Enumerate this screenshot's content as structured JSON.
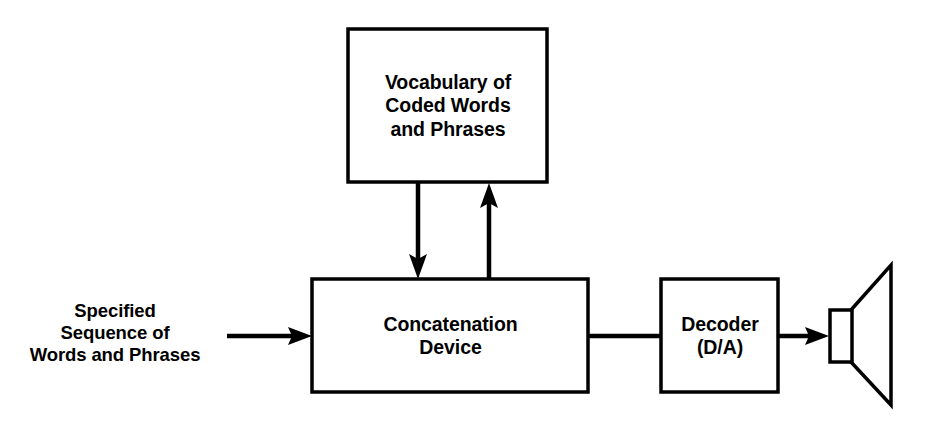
{
  "diagram": {
    "background_color": "#ffffff",
    "stroke_color": "#000000",
    "nodes": {
      "vocabulary": {
        "label": "Vocabulary of\nCoded Words\nand Phrases",
        "shape": "rectangle"
      },
      "concatenation": {
        "label": "Concatenation\nDevice",
        "shape": "rectangle"
      },
      "decoder": {
        "label": "Decoder\n(D/A)",
        "shape": "rectangle"
      },
      "input": {
        "label": "Specified\nSequence of\nWords and Phrases",
        "shape": "text"
      },
      "speaker": {
        "label": "loudspeaker",
        "shape": "horn"
      }
    },
    "connections": [
      {
        "name": "input-to-concatenation",
        "from": "input",
        "to": "concatenation",
        "arrow": "single",
        "direction": "right"
      },
      {
        "name": "vocabulary-to-concatenation",
        "from": "vocabulary",
        "to": "concatenation",
        "arrow": "single",
        "direction": "down"
      },
      {
        "name": "concatenation-to-vocabulary",
        "from": "concatenation",
        "to": "vocabulary",
        "arrow": "single",
        "direction": "up"
      },
      {
        "name": "concatenation-to-decoder",
        "from": "concatenation",
        "to": "decoder",
        "arrow": "none",
        "direction": "right"
      },
      {
        "name": "decoder-to-speaker",
        "from": "decoder",
        "to": "speaker",
        "arrow": "single",
        "direction": "right"
      }
    ]
  }
}
